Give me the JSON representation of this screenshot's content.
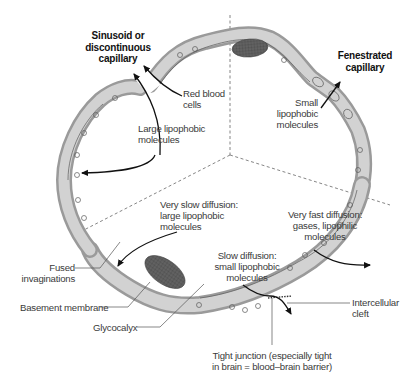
{
  "diagram": {
    "type": "capillary-cross-section",
    "sections": [
      {
        "id": "sinusoid",
        "title_line1": "Sinusoid or",
        "title_line2": "discontinuous",
        "title_line3": "capillary"
      },
      {
        "id": "fenestrated",
        "title_line1": "Fenestrated",
        "title_line2": "capillary"
      },
      {
        "id": "continuous",
        "title": ""
      }
    ],
    "labels": {
      "red_blood_cells": {
        "line1": "Red blood",
        "line2": "cells"
      },
      "large_lipophobic": {
        "line1": "Large lipophobic",
        "line2": "molecules"
      },
      "small_lipophobic_fen": {
        "line1": "Small",
        "line2": "lipophobic",
        "line3": "molecules"
      },
      "very_slow": {
        "line1": "Very slow diffusion:",
        "line2": "large lipophobic",
        "line3": "molecules"
      },
      "very_fast": {
        "line1": "Very fast diffusion:",
        "line2": "gases, lipophilic",
        "line3": "molecules"
      },
      "slow": {
        "line1": "Slow diffusion:",
        "line2": "small lipophobic",
        "line3": "molecules"
      },
      "fused": {
        "line1": "Fused",
        "line2": "invaginations"
      },
      "basement": {
        "line1": "Basement membrane"
      },
      "glycocalyx": {
        "line1": "Glycocalyx"
      },
      "intercellular": {
        "line1": "Intercellular",
        "line2": "cleft"
      },
      "tight_junction": {
        "line1": "Tight junction (especially tight",
        "line2": "in brain = blood–brain barrier)"
      }
    },
    "colors": {
      "wall_outer": "#9a9a9a",
      "wall_fill": "#d2d2d2",
      "wall_outline": "#5a5a5a",
      "nucleus": "#5e5e5e",
      "arrow": "#111111",
      "divider": "#777777",
      "text": "#3a3a3a"
    }
  }
}
